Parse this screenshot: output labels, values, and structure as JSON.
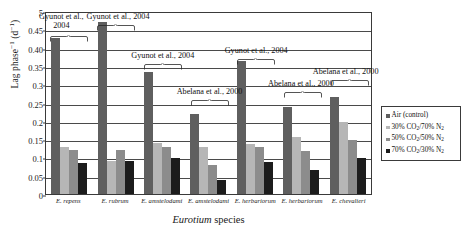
{
  "chart_data": {
    "type": "bar",
    "title": "",
    "xlabel": "Eurotium species",
    "ylabel": "Lag phase−1 (d−1)",
    "ylim": [
      0,
      0.5
    ],
    "grid": true,
    "legend_position": "right",
    "categories": [
      "E. repens",
      "E. rubrum",
      "E. amstelodami",
      "E. amstelodami",
      "E. herbariorum",
      "E. herbariorum",
      "E. chevalieri"
    ],
    "series": [
      {
        "name": "Air (control)",
        "color": "#5f5f5f",
        "values": [
          0.425,
          0.47,
          0.333,
          0.218,
          0.363,
          0.239,
          0.265
        ]
      },
      {
        "name": "30% CO2/70% N2",
        "color": "#b6b6b6",
        "values": [
          0.128,
          0.09,
          0.139,
          0.128,
          0.138,
          0.157,
          0.197
        ]
      },
      {
        "name": "50% CO2/50% N2",
        "color": "#8c8c8c",
        "values": [
          0.119,
          0.119,
          0.128,
          0.078,
          0.128,
          0.118,
          0.147
        ]
      },
      {
        "name": "70% CO2/30% N2",
        "color": "#1c1c1c",
        "values": [
          0.084,
          0.089,
          0.099,
          0.038,
          0.088,
          0.066,
          0.098
        ]
      }
    ],
    "ytick_labels": [
      "0",
      "0.05",
      "0.1",
      "0.15",
      "0.2",
      "0.25",
      "0.3",
      "0.35",
      "0.40",
      "0.45",
      "5"
    ],
    "ytick_values": [
      0,
      0.05,
      0.1,
      0.15,
      0.2,
      0.25,
      0.3,
      0.35,
      0.4,
      0.45,
      0.5
    ],
    "annotations": [
      {
        "text": "Gyunot et al., 2004",
        "groups": [
          0
        ]
      },
      {
        "text": "Gyunot et al., 2004",
        "groups": [
          1
        ]
      },
      {
        "text": "Gyunot et al., 2004",
        "groups": [
          2
        ]
      },
      {
        "text": "Abelana et al., 2000",
        "groups": [
          3
        ]
      },
      {
        "text": "Gyunot et al., 2004",
        "groups": [
          4
        ]
      },
      {
        "text": "Abelana et al., 2000",
        "groups": [
          5
        ]
      },
      {
        "text": "Abelana et al., 2000",
        "groups": [
          6
        ]
      }
    ]
  },
  "axes": {
    "y_title_main": "Lag phase",
    "y_title_sup1": "−1",
    "y_title_units": " (d",
    "y_title_sup2": "−1",
    "y_title_close": ")",
    "x_title_genus": "Eurotium",
    "x_title_rest": " species"
  },
  "legend": {
    "items": [
      {
        "label": "Air (control)",
        "label_pre": "Air (control)",
        "sub": "",
        "label_post": "",
        "color": "#5f5f5f"
      },
      {
        "label": "30% CO2/70% N2",
        "label_pre": "30% CO",
        "sub": "2",
        "label_post": "/70% N",
        "sub2": "2",
        "color": "#b6b6b6"
      },
      {
        "label": "50% CO2/50% N2",
        "label_pre": "50% CO",
        "sub": "2",
        "label_post": "/50% N",
        "sub2": "2",
        "color": "#8c8c8c"
      },
      {
        "label": "70% CO2/30% N2",
        "label_pre": "70% CO",
        "sub": "2",
        "label_post": "/30% N",
        "sub2": "2",
        "color": "#1c1c1c"
      }
    ]
  },
  "annotation_texts": {
    "a0_line1": "Gyunot et al.,",
    "a0_line2": "2004",
    "a1": "Gyunot et al., 2004",
    "a2": "Gyunot et al., 2004",
    "a3": "Abelana et al., 2000",
    "a4": "Gyunot et al., 2004",
    "a5": "Abelana et al., 2000",
    "a6": "Abelana et al., 2000"
  }
}
